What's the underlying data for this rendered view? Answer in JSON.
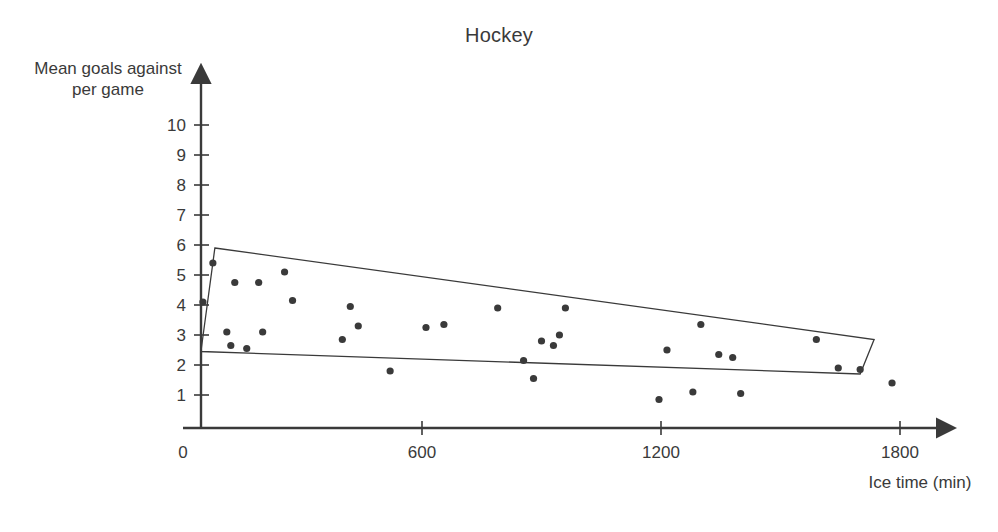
{
  "chart_data": {
    "type": "scatter",
    "title": "Hockey",
    "xlabel": "Ice time (min)",
    "ylabel": "Mean goals against per game",
    "xlim": [
      0,
      1900
    ],
    "ylim": [
      0,
      10.6
    ],
    "grid": false,
    "legend": null,
    "x_ticks": [
      0,
      600,
      1200,
      1800
    ],
    "x_tick_labels": [
      "0",
      "600",
      "1200",
      "1800"
    ],
    "y_ticks": [
      1,
      2,
      3,
      4,
      5,
      6,
      7,
      8,
      9,
      10
    ],
    "y_tick_labels": [
      "1",
      "2",
      "3",
      "4",
      "5",
      "6",
      "7",
      "8",
      "9",
      "10"
    ],
    "point_color": "#3a3a3a",
    "point_radius": 3.6,
    "series": [
      {
        "name": "teams",
        "points": [
          [
            50,
            4.1
          ],
          [
            75,
            5.4
          ],
          [
            110,
            3.1
          ],
          [
            120,
            2.65
          ],
          [
            130,
            4.75
          ],
          [
            160,
            2.55
          ],
          [
            190,
            4.75
          ],
          [
            200,
            3.1
          ],
          [
            255,
            5.1
          ],
          [
            275,
            4.15
          ],
          [
            400,
            2.85
          ],
          [
            420,
            3.95
          ],
          [
            440,
            3.3
          ],
          [
            520,
            1.8
          ],
          [
            610,
            3.25
          ],
          [
            655,
            3.35
          ],
          [
            790,
            3.9
          ],
          [
            855,
            2.15
          ],
          [
            880,
            1.55
          ],
          [
            900,
            2.8
          ],
          [
            930,
            2.65
          ],
          [
            945,
            3.0
          ],
          [
            960,
            3.9
          ],
          [
            1195,
            0.85
          ],
          [
            1215,
            2.5
          ],
          [
            1280,
            1.1
          ],
          [
            1300,
            3.35
          ],
          [
            1345,
            2.35
          ],
          [
            1380,
            2.25
          ],
          [
            1400,
            1.05
          ],
          [
            1590,
            2.85
          ],
          [
            1645,
            1.9
          ],
          [
            1700,
            1.85
          ],
          [
            1780,
            1.4
          ]
        ]
      }
    ],
    "annotations": [
      {
        "type": "parallelogram",
        "name": "correlation-band",
        "stroke": "#3a3a3a",
        "fill": "none",
        "vertices": [
          [
            80,
            5.9
          ],
          [
            1735,
            2.85
          ],
          [
            1700,
            1.7
          ],
          [
            45,
            2.45
          ]
        ]
      }
    ]
  }
}
